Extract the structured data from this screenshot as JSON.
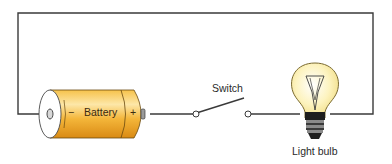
{
  "diagram": {
    "type": "simple electric circuit",
    "components": {
      "battery": {
        "label": "Battery",
        "negative_symbol": "−",
        "positive_symbol": "+"
      },
      "switch": {
        "label": "Switch",
        "state": "open"
      },
      "bulb": {
        "label": "Light bulb"
      }
    },
    "colors": {
      "wire": "#3a3a3a",
      "battery_body": "#f2b230",
      "battery_highlight": "#fde7a8",
      "battery_end": "#ffffff",
      "bulb_glass": "#fdf6c8",
      "bulb_base": "#2b2b2b"
    }
  }
}
